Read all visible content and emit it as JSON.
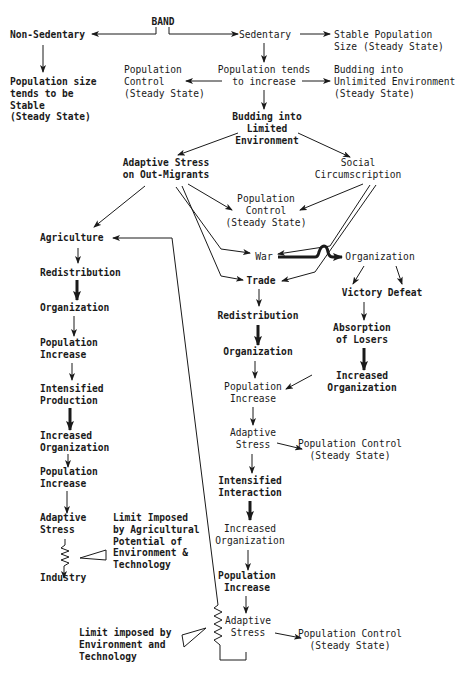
{
  "nodes": {
    "band": {
      "lines": [
        "BAND"
      ],
      "bold": true
    },
    "non_sedentary": {
      "lines": [
        "Non-Sedentary"
      ],
      "bold": true
    },
    "pop_stable": {
      "lines": [
        "Population size",
        "tends to be",
        "Stable",
        "(Steady State)"
      ],
      "bold": true
    },
    "sedentary": {
      "lines": [
        "Sedentary"
      ]
    },
    "stable_pop_size": {
      "lines": [
        "Stable Population",
        "Size (Steady State)"
      ]
    },
    "pop_tends_increase": {
      "lines": [
        "Population tends",
        "to increase"
      ]
    },
    "pop_control_1": {
      "lines": [
        "Population",
        "Control",
        "(Steady State)"
      ]
    },
    "budding_unlimited": {
      "lines": [
        "Budding into",
        "Unlimited Environment",
        "(Steady State)"
      ]
    },
    "budding_limited": {
      "lines": [
        "Budding into",
        "Limited",
        "Environment"
      ],
      "bold": true
    },
    "adaptive_stress_out": {
      "lines": [
        "Adaptive Stress",
        "on Out-Migrants"
      ],
      "bold": true
    },
    "social_circ": {
      "lines": [
        "Social",
        "Circumscription"
      ]
    },
    "pop_control_2": {
      "lines": [
        "Population",
        "Control",
        "(Steady State)"
      ]
    },
    "agriculture": {
      "lines": [
        "Agriculture"
      ],
      "bold": true
    },
    "redistribution_l": {
      "lines": [
        "Redistribution"
      ],
      "bold": true
    },
    "organization_l": {
      "lines": [
        "Organization"
      ],
      "bold": true
    },
    "pop_increase_l1": {
      "lines": [
        "Population",
        "Increase"
      ],
      "bold": true
    },
    "intensified_prod": {
      "lines": [
        "Intensified",
        "Production"
      ],
      "bold": true
    },
    "increased_org_l": {
      "lines": [
        "Increased",
        "Organization"
      ],
      "bold": true
    },
    "pop_increase_l2": {
      "lines": [
        "Population",
        "Increase"
      ],
      "bold": true
    },
    "adaptive_stress_l": {
      "lines": [
        "Adaptive",
        "Stress"
      ],
      "bold": true
    },
    "industry": {
      "lines": [
        "Industry"
      ],
      "bold": true
    },
    "limit_agri": {
      "lines": [
        "Limit Imposed",
        "by Agricultural",
        "Potential of",
        "Environment &",
        "Technology"
      ],
      "bold": true
    },
    "war": {
      "lines": [
        "War"
      ]
    },
    "trade": {
      "lines": [
        "Trade"
      ],
      "bold": true
    },
    "organization_war": {
      "lines": [
        "Organization"
      ]
    },
    "victory": {
      "lines": [
        "Victory"
      ],
      "bold": true
    },
    "defeat": {
      "lines": [
        "Defeat"
      ],
      "bold": true
    },
    "absorption": {
      "lines": [
        "Absorption",
        "of Losers"
      ],
      "bold": true
    },
    "increased_org_v": {
      "lines": [
        "Increased",
        "Organization"
      ],
      "bold": true
    },
    "redistribution_r": {
      "lines": [
        "Redistribution"
      ],
      "bold": true
    },
    "organization_r": {
      "lines": [
        "Organization"
      ],
      "bold": true
    },
    "pop_increase_r1": {
      "lines": [
        "Population",
        "Increase"
      ]
    },
    "adaptive_stress_r1": {
      "lines": [
        "Adaptive",
        "Stress"
      ]
    },
    "pop_control_3": {
      "lines": [
        "Population Control",
        "(Steady State)"
      ]
    },
    "intensified_int": {
      "lines": [
        "Intensified",
        "Interaction"
      ],
      "bold": true
    },
    "increased_org_r": {
      "lines": [
        "Increased",
        "Organization"
      ]
    },
    "pop_increase_r2": {
      "lines": [
        "Population",
        "Increase"
      ],
      "bold": true
    },
    "adaptive_stress_r2": {
      "lines": [
        "Adaptive",
        "Stress"
      ]
    },
    "pop_control_4": {
      "lines": [
        "Population Control",
        "(Steady State)"
      ]
    },
    "limit_env": {
      "lines": [
        "Limit imposed by",
        "Environment and",
        "Technology"
      ],
      "bold": true
    }
  }
}
